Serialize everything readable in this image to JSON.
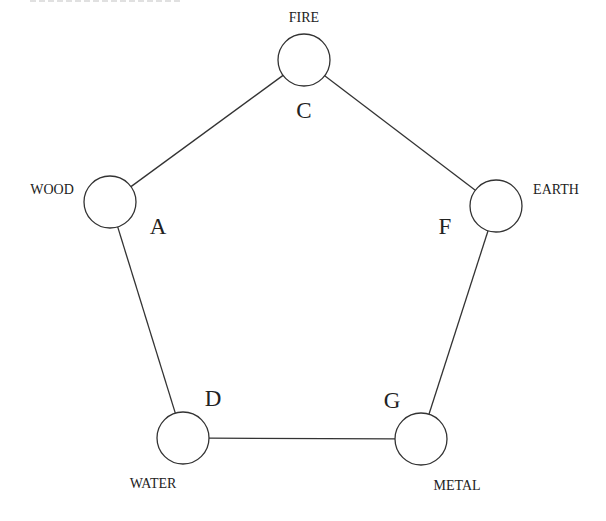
{
  "diagram": {
    "type": "pentagon-cycle",
    "nodes": [
      {
        "id": "fire",
        "element": "FIRE",
        "letter": "C",
        "cx": 304,
        "cy": 60,
        "r": 26,
        "label_x": 304,
        "label_y": 22,
        "label_anchor": "middle",
        "letter_x": 304,
        "letter_y": 118
      },
      {
        "id": "wood",
        "element": "WOOD",
        "letter": "A",
        "cx": 110,
        "cy": 202,
        "r": 26,
        "label_x": 52,
        "label_y": 194,
        "label_anchor": "middle",
        "letter_x": 158,
        "letter_y": 234
      },
      {
        "id": "earth",
        "element": "EARTH",
        "letter": "F",
        "cx": 496,
        "cy": 206,
        "r": 26,
        "label_x": 556,
        "label_y": 194,
        "label_anchor": "middle",
        "letter_x": 445,
        "letter_y": 234
      },
      {
        "id": "water",
        "element": "WATER",
        "letter": "D",
        "cx": 183,
        "cy": 438,
        "r": 26,
        "label_x": 153,
        "label_y": 488,
        "label_anchor": "middle",
        "letter_x": 213,
        "letter_y": 406
      },
      {
        "id": "metal",
        "element": "METAL",
        "letter": "G",
        "cx": 421,
        "cy": 439,
        "r": 26,
        "label_x": 457,
        "label_y": 490,
        "label_anchor": "middle",
        "letter_x": 392,
        "letter_y": 408
      }
    ],
    "edges": [
      {
        "from": "fire",
        "to": "wood"
      },
      {
        "from": "fire",
        "to": "earth"
      },
      {
        "from": "wood",
        "to": "water"
      },
      {
        "from": "earth",
        "to": "metal"
      },
      {
        "from": "water",
        "to": "metal"
      }
    ],
    "colors": {
      "stroke": "#333333",
      "text": "#222222",
      "background": "#ffffff"
    }
  }
}
